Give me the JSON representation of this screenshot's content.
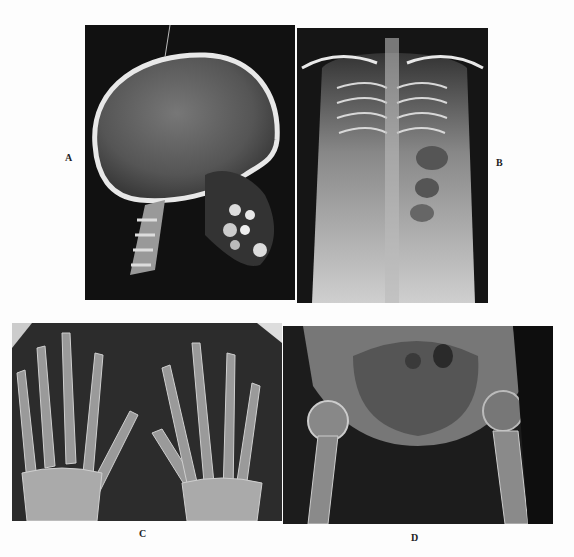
{
  "figure": {
    "panels": [
      {
        "id": "A",
        "label": "A",
        "subject": "lateral skull radiograph"
      },
      {
        "id": "B",
        "label": "B",
        "subject": "anteroposterior chest and abdomen radiograph"
      },
      {
        "id": "C",
        "label": "C",
        "subject": "bilateral hand radiograph"
      },
      {
        "id": "D",
        "label": "D",
        "subject": "pelvis and hips radiograph"
      }
    ]
  }
}
